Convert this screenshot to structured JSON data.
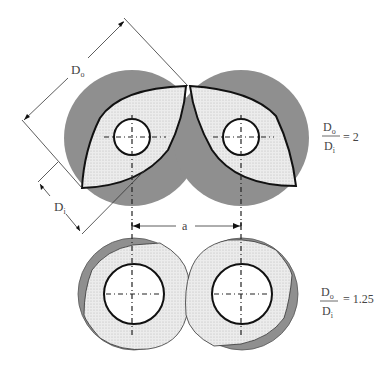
{
  "labels": {
    "outer_diameter": "D",
    "outer_sub": "o",
    "inner_diameter": "D",
    "inner_sub": "i",
    "center_distance": "a"
  },
  "ratios": [
    {
      "num": "D",
      "num_sub": "o",
      "den": "D",
      "den_sub": "i",
      "value": "= 2"
    },
    {
      "num": "D",
      "num_sub": "o",
      "den": "D",
      "den_sub": "i",
      "value": "= 1.25"
    }
  ],
  "colors": {
    "barrel": "#8f8f8f",
    "flight": "#e6e6e6",
    "line": "#111111"
  }
}
